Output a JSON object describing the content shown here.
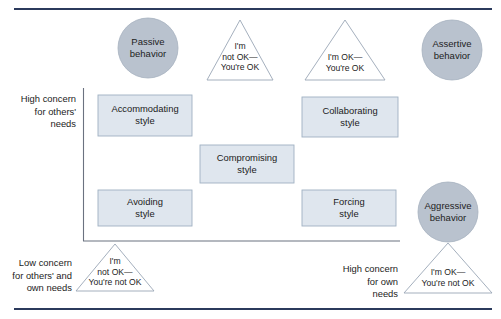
{
  "figure": {
    "title_rule_color": "#2b3a5c",
    "circle_fill": "#b9c2ce",
    "circle_stroke": "#9aa6b5",
    "box_fill": "#dfe6ee",
    "box_stroke": "#9fb0c2",
    "triangle_stroke": "#9aa6b5",
    "axis_stroke": "#6b7280"
  },
  "circles": [
    {
      "name": "passive-behavior",
      "label": "Passive\nbehavior",
      "cx": 148,
      "cy": 48,
      "r": 30
    },
    {
      "name": "assertive-behavior",
      "label": "Assertive\nbehavior",
      "cx": 452,
      "cy": 50,
      "r": 30
    },
    {
      "name": "aggressive-behavior",
      "label": "Aggressive\nbehavior",
      "cx": 448,
      "cy": 212,
      "r": 30
    }
  ],
  "triangles": [
    {
      "name": "im-not-ok-youre-ok",
      "label": "I'm\nnot OK—\nYou're OK",
      "apex_x": 240,
      "apex_y": 20,
      "base_y": 80,
      "half_width": 33
    },
    {
      "name": "im-ok-youre-ok",
      "label": "I'm OK—\nYou're OK",
      "apex_x": 345,
      "apex_y": 20,
      "base_y": 80,
      "half_width": 40
    },
    {
      "name": "im-not-ok-youre-not-ok",
      "label": "I'm\nnot OK—\nYou're not OK",
      "apex_x": 115,
      "apex_y": 244,
      "base_y": 291,
      "half_width": 39
    },
    {
      "name": "im-ok-youre-not-ok",
      "label": "I'm OK—\nYou're not OK",
      "apex_x": 448,
      "apex_y": 243,
      "base_y": 293,
      "half_width": 44
    }
  ],
  "style_boxes": [
    {
      "name": "accommodating-style",
      "label": "Accommodating\nstyle",
      "x": 98,
      "y": 95,
      "w": 94,
      "h": 41
    },
    {
      "name": "collaborating-style",
      "label": "Collaborating\nstyle",
      "x": 302,
      "y": 97,
      "w": 96,
      "h": 40
    },
    {
      "name": "compromising-style",
      "label": "Compromising\nstyle",
      "x": 200,
      "y": 145,
      "w": 94,
      "h": 38
    },
    {
      "name": "avoiding-style",
      "label": "Avoiding\nstyle",
      "x": 98,
      "y": 190,
      "w": 94,
      "h": 36
    },
    {
      "name": "forcing-style",
      "label": "Forcing\nstyle",
      "x": 302,
      "y": 190,
      "w": 94,
      "h": 36
    }
  ],
  "axis_labels": {
    "high_concern_others": "High concern\nfor others'\nneeds",
    "low_concern_others": "Low concern\nfor others' and\nown needs",
    "high_concern_own": "High concern\nfor own\nneeds"
  }
}
